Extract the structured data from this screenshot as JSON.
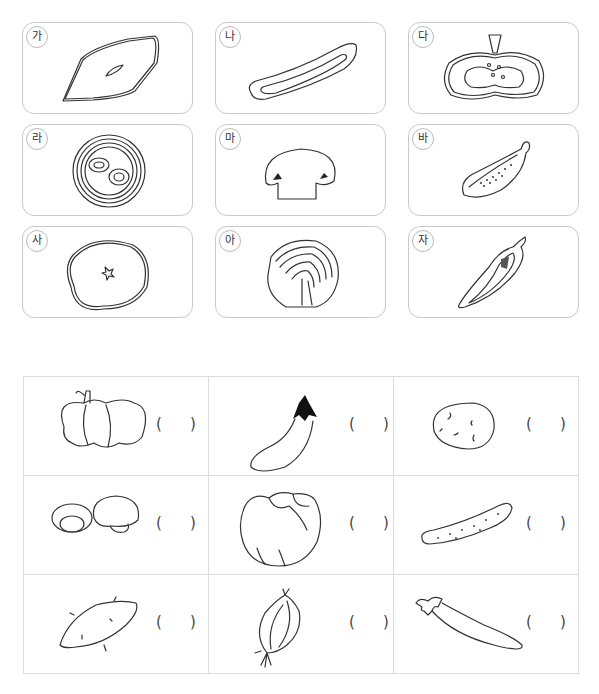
{
  "header": {
    "instruction_partial": ""
  },
  "cards": [
    {
      "label": "가",
      "icon": "sweet-potato-cross-section"
    },
    {
      "label": "나",
      "icon": "cucumber-cross-section"
    },
    {
      "label": "다",
      "icon": "pumpkin-cross-section"
    },
    {
      "label": "라",
      "icon": "onion-cross-section"
    },
    {
      "label": "마",
      "icon": "mushroom-cross-section"
    },
    {
      "label": "바",
      "icon": "eggplant-cross-section"
    },
    {
      "label": "사",
      "icon": "potato-cross-section"
    },
    {
      "label": "아",
      "icon": "cabbage-cross-section"
    },
    {
      "label": "자",
      "icon": "pepper-cross-section"
    }
  ],
  "answer_table": {
    "rows": [
      [
        {
          "icon": "pumpkin",
          "open": "(",
          "close": ")"
        },
        {
          "icon": "eggplant",
          "open": "(",
          "close": ")"
        },
        {
          "icon": "potato",
          "open": "(",
          "close": ")"
        }
      ],
      [
        {
          "icon": "mushrooms",
          "open": "(",
          "close": ")"
        },
        {
          "icon": "cabbage",
          "open": "(",
          "close": ")"
        },
        {
          "icon": "cucumber",
          "open": "(",
          "close": ")"
        }
      ],
      [
        {
          "icon": "sweet-potato",
          "open": "(",
          "close": ")"
        },
        {
          "icon": "onion",
          "open": "(",
          "close": ")"
        },
        {
          "icon": "chili-pepper",
          "open": "(",
          "close": ")"
        }
      ]
    ]
  }
}
